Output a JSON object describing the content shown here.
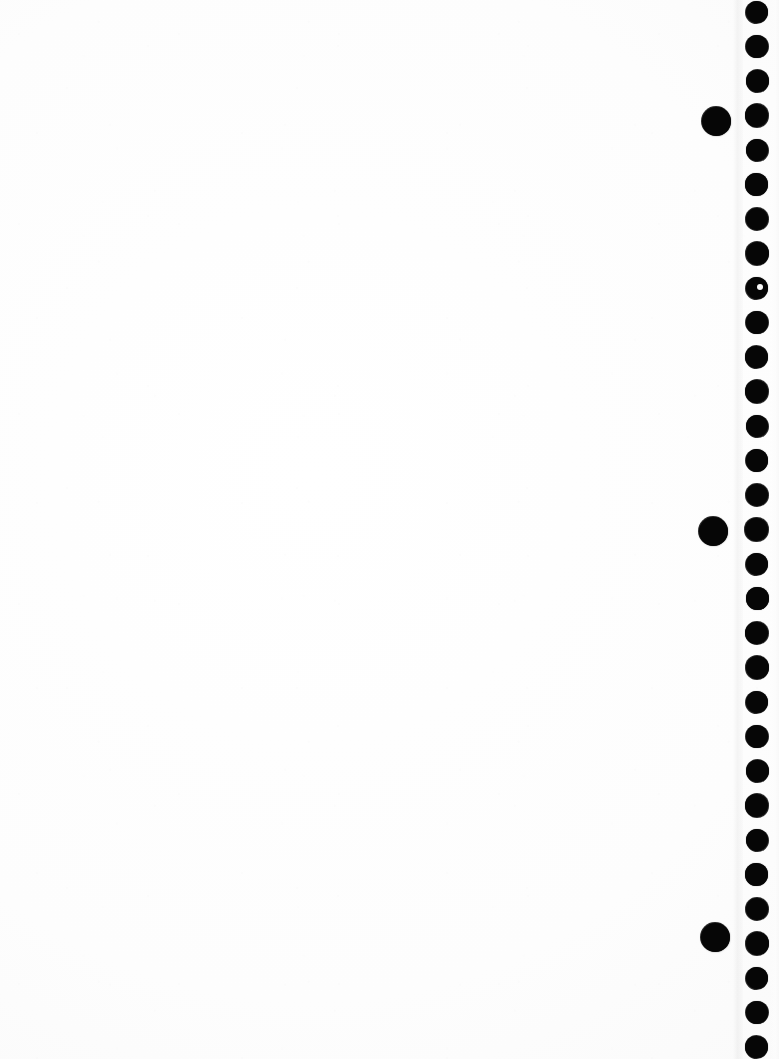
{
  "page": {
    "kind": "scanned-blank-page",
    "width": 779,
    "height": 1059,
    "background_color": "#fdfdfd",
    "ink_color": "#0a0a0a",
    "visible_text": "",
    "content_note": ""
  },
  "page_edge": {
    "x": 733,
    "width": 10,
    "margin_x": 770,
    "margin_width": 9
  },
  "edge_dots": {
    "label": "",
    "count": 31,
    "diameter": 22,
    "center_x": 757,
    "first_center_y": 12,
    "spacing": 34.5,
    "color": "#0a0a0a",
    "centers_y": [
      12,
      46.5,
      81,
      115.5,
      150,
      184.5,
      219,
      253.5,
      288,
      322.5,
      357,
      391.5,
      426,
      460.5,
      495,
      529.5,
      564,
      598.5,
      633,
      667.5,
      702,
      736.5,
      771,
      805.5,
      840,
      874.5,
      909,
      943.5,
      978,
      1012.5,
      1047
    ]
  },
  "offset_dots": {
    "label": "",
    "count": 3,
    "diameter": 29,
    "color": "#0a0a0a",
    "items": [
      {
        "cx": 716,
        "cy": 121
      },
      {
        "cx": 713,
        "cy": 531
      },
      {
        "cx": 715,
        "cy": 937
      }
    ]
  },
  "artifacts": {
    "notch": {
      "cx": 760,
      "cy": 287,
      "r": 3.2
    }
  }
}
